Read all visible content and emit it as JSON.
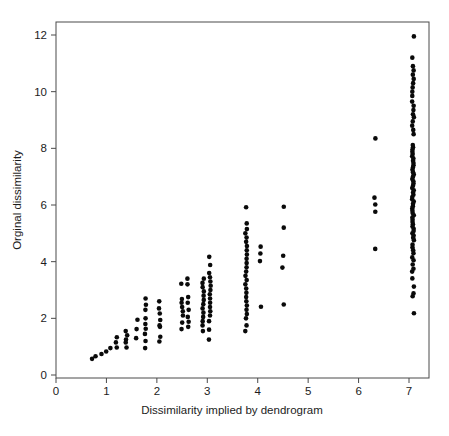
{
  "figure": {
    "background_color": "#ffffff",
    "marker_color": "#0a0a0a",
    "axis_color": "#4a4a4a",
    "text_color": "#1c1c1c"
  },
  "chart_data": {
    "type": "scatter",
    "title": "",
    "xlabel": "Dissimilarity implied by dendrogram",
    "ylabel": "Orginal dissimilarity",
    "xticks": [
      0,
      1,
      2,
      3,
      4,
      5,
      6,
      7
    ],
    "yticks": [
      0,
      2,
      4,
      6,
      8,
      10,
      12
    ],
    "xlim": [
      0,
      7.4
    ],
    "ylim": [
      -0.1,
      12.45
    ],
    "grid": false,
    "legend": "none",
    "marker": "filled-circle",
    "marker_radius": 2.3,
    "columns": [
      {
        "x": 0.7,
        "ys": [
          0.57
        ]
      },
      {
        "x": 0.8,
        "ys": [
          0.66
        ]
      },
      {
        "x": 0.9,
        "ys": [
          0.74
        ]
      },
      {
        "x": 1.0,
        "ys": [
          0.83
        ]
      },
      {
        "x": 1.08,
        "ys": [
          0.95
        ]
      },
      {
        "x": 1.2,
        "ys": [
          0.97,
          1.15,
          1.33
        ]
      },
      {
        "x": 1.4,
        "ys": [
          0.97,
          1.15,
          1.25,
          1.4,
          1.55
        ]
      },
      {
        "x": 1.6,
        "ys": [
          1.3,
          1.62,
          1.95
        ]
      },
      {
        "x": 1.77,
        "ys": [
          0.95,
          1.2,
          1.45,
          1.63,
          1.8,
          2.0,
          2.3,
          2.48,
          2.7
        ]
      },
      {
        "x": 2.05,
        "ys": [
          1.18,
          1.35,
          1.7,
          1.75,
          1.94,
          2.17,
          2.35,
          2.6
        ]
      },
      {
        "x": 2.5,
        "ys": [
          1.62,
          1.85,
          2.1,
          2.25,
          2.4,
          2.55,
          2.68,
          3.22
        ]
      },
      {
        "x": 2.62,
        "ys": [
          1.7,
          1.88,
          2.05,
          2.3,
          2.55,
          2.75,
          3.2,
          3.4
        ]
      },
      {
        "x": 2.92,
        "ys": [
          1.55,
          1.75,
          1.9,
          2.05,
          2.2,
          2.35,
          2.5,
          2.65,
          2.8,
          2.95,
          3.1,
          3.25,
          3.4
        ]
      },
      {
        "x": 3.05,
        "ys": [
          1.25,
          1.6,
          1.9,
          2.1,
          2.25,
          2.4,
          2.55,
          2.7,
          2.85,
          3.0,
          3.15,
          3.3,
          3.45,
          3.6,
          3.88,
          4.17
        ]
      },
      {
        "x": 3.77,
        "ys": [
          1.55,
          1.75,
          2.0,
          2.15,
          2.3,
          2.45,
          2.6,
          2.75,
          2.9,
          3.05,
          3.2,
          3.35,
          3.5,
          3.65,
          3.8,
          3.95,
          4.1,
          4.25,
          4.4,
          4.55,
          4.7,
          4.85,
          5.0,
          5.15,
          5.35,
          5.92
        ]
      },
      {
        "x": 4.05,
        "ys": [
          2.41,
          4.02,
          4.29,
          4.53
        ]
      },
      {
        "x": 4.5,
        "ys": [
          2.49,
          3.79,
          4.21,
          5.2,
          5.94
        ]
      },
      {
        "x": 6.33,
        "ys": [
          4.45,
          5.76,
          6.02,
          6.26,
          8.35
        ]
      },
      {
        "x": 7.08,
        "ys": [
          2.18,
          2.78,
          2.88,
          3.12,
          3.41,
          3.65,
          3.75,
          3.9,
          4.05,
          4.15,
          4.3,
          4.4,
          4.5,
          4.6,
          4.76,
          4.84,
          4.92,
          5.0,
          5.08,
          5.16,
          5.24,
          5.32,
          5.4,
          5.48,
          5.56,
          5.64,
          5.72,
          5.8,
          5.88,
          5.96,
          6.04,
          6.12,
          6.2,
          6.28,
          6.36,
          6.44,
          6.52,
          6.6,
          6.68,
          6.76,
          6.84,
          6.92,
          7.0,
          7.08,
          7.16,
          7.24,
          7.32,
          7.4,
          7.48,
          7.56,
          7.64,
          7.72,
          7.8,
          7.88,
          7.96,
          8.04,
          8.12,
          8.5,
          8.65,
          8.8,
          8.95,
          9.1,
          9.2,
          9.35,
          9.5,
          9.65,
          9.85,
          10.0,
          10.15,
          10.3,
          10.45,
          10.6,
          10.75,
          10.9,
          11.2,
          11.95
        ]
      }
    ]
  }
}
